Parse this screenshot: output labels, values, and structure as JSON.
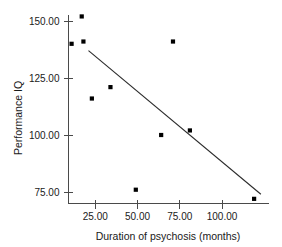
{
  "chart_data": {
    "type": "scatter",
    "title": "",
    "xlabel": "Duration of psychosis (months)",
    "ylabel": "Performance IQ",
    "xlim": [
      8,
      130
    ],
    "ylim": [
      68,
      158
    ],
    "grid": false,
    "legend": "none",
    "xticks": [
      25,
      50,
      75,
      100
    ],
    "xtick_labels": [
      "25.00",
      "50.00",
      "75.00",
      "100.00"
    ],
    "yticks": [
      75,
      100,
      125,
      150
    ],
    "ytick_labels": [
      "75.00",
      "100.00",
      "125.00",
      "150.00"
    ],
    "points": [
      {
        "x": 17,
        "y": 152
      },
      {
        "x": 11,
        "y": 140
      },
      {
        "x": 18,
        "y": 141
      },
      {
        "x": 23,
        "y": 116
      },
      {
        "x": 34,
        "y": 121
      },
      {
        "x": 49,
        "y": 76
      },
      {
        "x": 64,
        "y": 100
      },
      {
        "x": 71,
        "y": 141
      },
      {
        "x": 81,
        "y": 102
      },
      {
        "x": 119,
        "y": 72
      }
    ],
    "marker": "filled-square",
    "marker_color": "#000000",
    "fit_line": {
      "type": "linear-regression",
      "x_start": 21,
      "y_start": 137,
      "x_end": 123,
      "y_end": 74,
      "color": "#2b2b2b"
    }
  }
}
